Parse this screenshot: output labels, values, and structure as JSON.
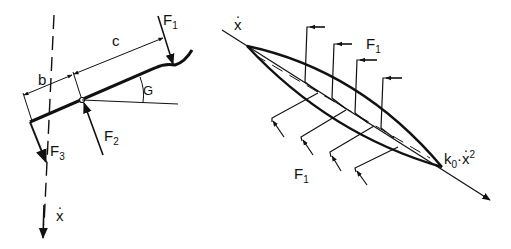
{
  "figure": {
    "left": {
      "title": "Lever (rudder) force diagram",
      "labels": {
        "f1": {
          "main": "F",
          "sub": "1"
        },
        "f2": {
          "main": "F",
          "sub": "2"
        },
        "f3": {
          "main": "F",
          "sub": "3"
        },
        "b": "b",
        "c": "c",
        "angle": "G",
        "velocity": "x"
      }
    },
    "right": {
      "title": "Blade force distribution",
      "labels": {
        "velocity": "x",
        "f1_top": {
          "main": "F",
          "sub": "1"
        },
        "f1_bottom": {
          "main": "F",
          "sub": "1"
        },
        "drag": {
          "coef": "k",
          "coef_sub": "0",
          "dot": "·",
          "var": "x",
          "exp": "2"
        }
      }
    },
    "colors": {
      "ink": "#111111",
      "background": "#ffffff"
    }
  }
}
